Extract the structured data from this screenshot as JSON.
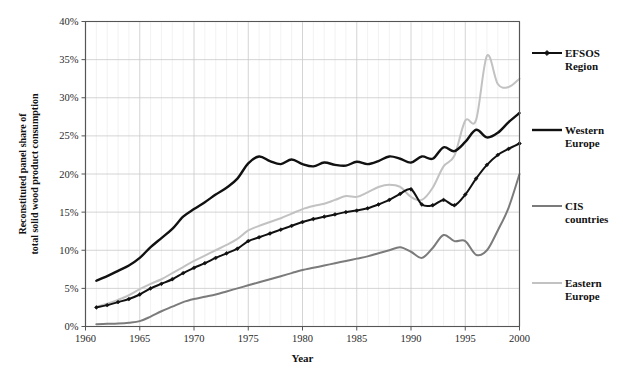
{
  "chart_data": {
    "type": "line",
    "title": "",
    "xlabel": "Year",
    "ylabel": "Reconstituted panel share of total solid wood product consumption",
    "ylabel_line1": "Reconstituted panel share of",
    "ylabel_line2": "total solid wood product consumption",
    "xlim": [
      1960,
      2000
    ],
    "ylim": [
      0,
      40
    ],
    "y_tick_labels": [
      "0%",
      "5%",
      "10%",
      "15%",
      "20%",
      "25%",
      "30%",
      "35%",
      "40%"
    ],
    "y_ticks": [
      0,
      5,
      10,
      15,
      20,
      25,
      30,
      35,
      40
    ],
    "x_tick_labels": [
      "1960",
      "1965",
      "1970",
      "1975",
      "1980",
      "1985",
      "1990",
      "1995",
      "2000"
    ],
    "x_ticks": [
      1960,
      1965,
      1970,
      1975,
      1980,
      1985,
      1990,
      1995,
      2000
    ],
    "x_minor_step": 1,
    "grid": "major-xy",
    "legend_position": "right",
    "units": "percent",
    "x": [
      1961,
      1962,
      1963,
      1964,
      1965,
      1966,
      1967,
      1968,
      1969,
      1970,
      1971,
      1972,
      1973,
      1974,
      1975,
      1976,
      1977,
      1978,
      1979,
      1980,
      1981,
      1982,
      1983,
      1984,
      1985,
      1986,
      1987,
      1988,
      1989,
      1990,
      1991,
      1992,
      1993,
      1994,
      1995,
      1996,
      1997,
      1998,
      1999,
      2000
    ],
    "series": [
      {
        "name": "EFSOS Region",
        "color": "#111111",
        "width": 2.0,
        "marker": "diamond",
        "values": [
          2.5,
          2.8,
          3.2,
          3.6,
          4.2,
          5.0,
          5.6,
          6.2,
          7.0,
          7.7,
          8.3,
          9.0,
          9.6,
          10.2,
          11.2,
          11.7,
          12.2,
          12.7,
          13.2,
          13.7,
          14.1,
          14.4,
          14.7,
          15.0,
          15.2,
          15.5,
          16.0,
          16.6,
          17.4,
          18.0,
          16.0,
          15.9,
          16.6,
          15.9,
          17.3,
          19.4,
          21.2,
          22.5,
          23.3,
          24.0
        ]
      },
      {
        "name": "Western Europe",
        "color": "#111111",
        "width": 2.4,
        "marker": "none",
        "values": [
          6.0,
          6.6,
          7.3,
          8.0,
          9.0,
          10.4,
          11.6,
          12.8,
          14.4,
          15.4,
          16.3,
          17.3,
          18.2,
          19.4,
          21.4,
          22.3,
          21.7,
          21.3,
          21.9,
          21.3,
          21.0,
          21.5,
          21.2,
          21.1,
          21.6,
          21.3,
          21.7,
          22.3,
          22.0,
          21.5,
          22.3,
          22.0,
          23.5,
          23.0,
          24.2,
          25.8,
          24.8,
          25.4,
          26.8,
          28.0
        ]
      },
      {
        "name": "CIS countries",
        "color": "#7b7b7b",
        "width": 2.0,
        "marker": "none",
        "values": [
          0.3,
          0.35,
          0.4,
          0.5,
          0.7,
          1.3,
          2.0,
          2.6,
          3.2,
          3.6,
          3.9,
          4.2,
          4.6,
          5.0,
          5.4,
          5.8,
          6.2,
          6.6,
          7.0,
          7.4,
          7.7,
          8.0,
          8.3,
          8.6,
          8.9,
          9.2,
          9.6,
          10.0,
          10.4,
          9.8,
          9.0,
          10.3,
          12.0,
          11.2,
          11.2,
          9.4,
          10.0,
          12.6,
          15.6,
          20.0
        ]
      },
      {
        "name": "Eastern Europe",
        "color": "#c2c2c2",
        "width": 2.0,
        "marker": "none",
        "values": [
          2.6,
          3.0,
          3.5,
          4.1,
          4.9,
          5.6,
          6.2,
          7.0,
          7.8,
          8.6,
          9.3,
          10.0,
          10.7,
          11.5,
          12.6,
          13.2,
          13.7,
          14.2,
          14.8,
          15.4,
          15.8,
          16.1,
          16.6,
          17.1,
          17.0,
          17.6,
          18.3,
          18.6,
          18.3,
          17.0,
          16.6,
          18.2,
          21.0,
          22.4,
          27.0,
          27.1,
          35.5,
          31.8,
          31.4,
          32.5
        ]
      }
    ],
    "legend_entries": [
      {
        "label_line1": "EFSOS",
        "label_line2": "Region",
        "color": "#111111",
        "marker": "diamond",
        "width": 2.0
      },
      {
        "label_line1": "Western",
        "label_line2": "Europe",
        "color": "#111111",
        "marker": "none",
        "width": 2.4
      },
      {
        "label_line1": "CIS",
        "label_line2": "countries",
        "color": "#7b7b7b",
        "marker": "none",
        "width": 2.0
      },
      {
        "label_line1": "Eastern",
        "label_line2": "Europe",
        "color": "#c2c2c2",
        "marker": "none",
        "width": 2.0
      }
    ],
    "colors": {
      "background": "#ffffff",
      "grid_major": "#c9c9c9",
      "grid_minor": "#ededed",
      "axis": "#555555",
      "text": "#111111"
    }
  }
}
